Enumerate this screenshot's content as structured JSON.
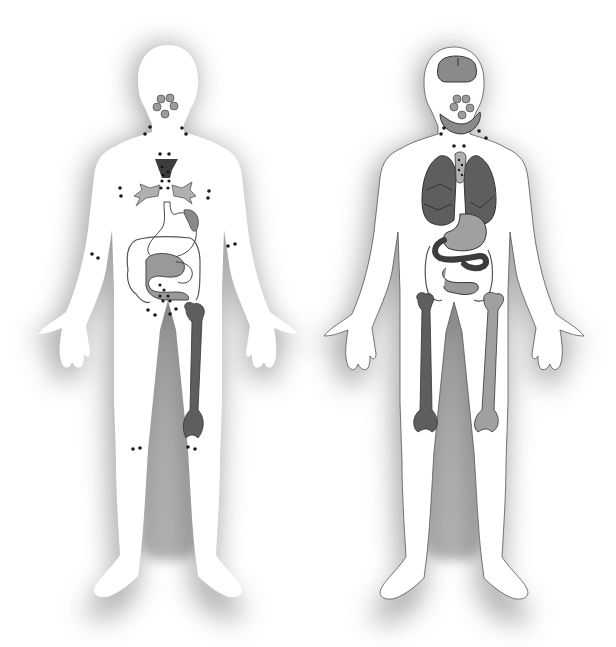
{
  "illustration": {
    "subject": "Two human figures showing lymph nodes and internal organs",
    "figures": [
      {
        "id": "left",
        "label": "Figure with lymph nodes, thymus, spleen, intestines and femur",
        "organs": [
          "tonsils",
          "thymus",
          "bronchi",
          "spleen",
          "stomach",
          "large-intestine",
          "small-intestine",
          "femur"
        ],
        "lymph_node_groups": [
          "neck",
          "axilla",
          "elbow",
          "groin",
          "knee"
        ]
      },
      {
        "id": "right",
        "label": "Figure with brain, tonsils, thyroid, lungs, heart, stomach, intestines and two femurs",
        "organs": [
          "brain",
          "tonsils",
          "thyroid",
          "lungs",
          "thymus",
          "stomach",
          "colon",
          "small-intestine",
          "femur-left",
          "femur-right"
        ],
        "lymph_node_groups": [
          "neck",
          "chest"
        ]
      }
    ]
  },
  "colors": {
    "background": "#ffffff",
    "shadow": "#9a9a9a",
    "body": "#ffffff",
    "outline": "#3a3a3a",
    "organ_light": "#a8a8a8",
    "organ_mid": "#8a8a8a",
    "organ_dark": "#5e5e5e",
    "organ_darkest": "#3c3c3c",
    "node": "#1a1a1a"
  }
}
